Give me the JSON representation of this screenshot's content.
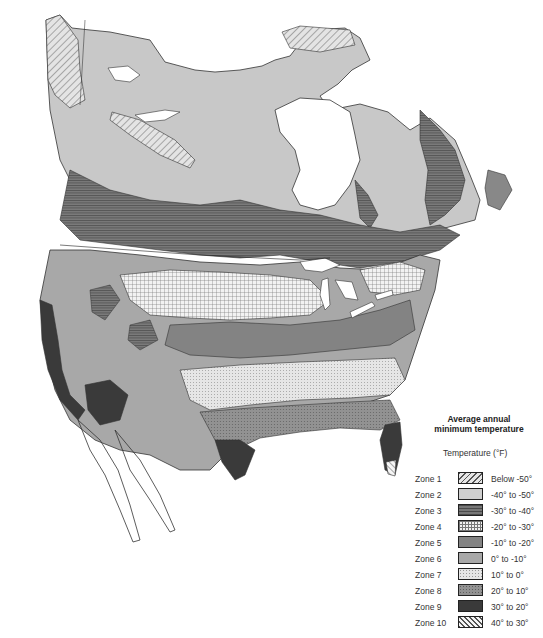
{
  "map": {
    "title": "Average annual minimum temperature",
    "region": "North America",
    "type": "plant hardiness zone map"
  },
  "legend": {
    "title_line1": "Average annual",
    "title_line2": "minimum temperature",
    "subtitle": "Temperature  (°F)",
    "zones": [
      {
        "zone": "Zone 1",
        "range": "Below -50°",
        "pattern": "diagonal-hatch",
        "color": "#dcdcdc"
      },
      {
        "zone": "Zone 2",
        "range": "-40° to -50°",
        "pattern": "solid-light",
        "color": "#c8c8c8"
      },
      {
        "zone": "Zone 3",
        "range": "-30° to -40°",
        "pattern": "horizontal-lines-dark",
        "color": "#6e6e6e"
      },
      {
        "zone": "Zone 4",
        "range": "-20° to -30°",
        "pattern": "crosshatch-grid",
        "color": "#f0f0f0"
      },
      {
        "zone": "Zone 5",
        "range": "-10° to -20°",
        "pattern": "solid-medium-dark",
        "color": "#838383"
      },
      {
        "zone": "Zone 6",
        "range": "0° to -10°",
        "pattern": "solid-medium",
        "color": "#a8a8a8"
      },
      {
        "zone": "Zone 7",
        "range": "10° to 0°",
        "pattern": "stipple-light",
        "color": "#e2e2e2"
      },
      {
        "zone": "Zone 8",
        "range": "20° to 10°",
        "pattern": "stipple-dark",
        "color": "#8c8c8c"
      },
      {
        "zone": "Zone 9",
        "range": "30° to 20°",
        "pattern": "solid-dark",
        "color": "#3a3a3a"
      },
      {
        "zone": "Zone 10",
        "range": "40° to 30°",
        "pattern": "diagonal-hatch-reverse",
        "color": "#f4f4f4"
      }
    ]
  }
}
